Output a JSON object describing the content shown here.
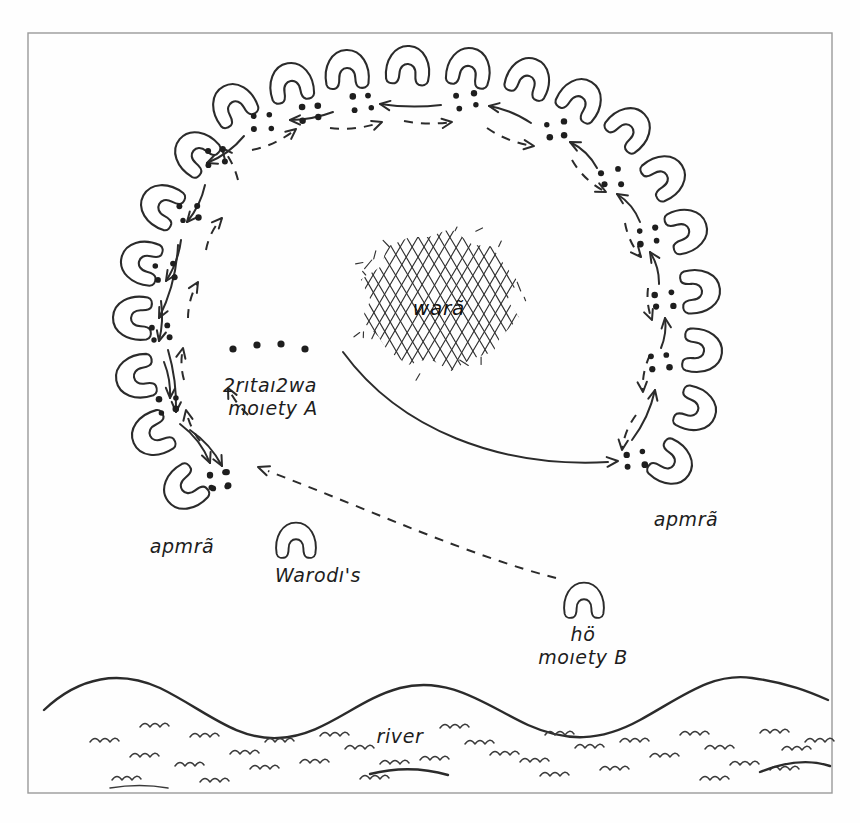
{
  "figure": {
    "type": "hand-drawn-ethnographic-diagram",
    "title_center": "warã",
    "background_color": "#fefefe",
    "ink_color": "#2b2b2b",
    "frame": {
      "x": 28,
      "y": 33,
      "width": 804,
      "height": 760
    }
  },
  "labels": {
    "center_plaza": "warã",
    "moiety_a_name": "2rıtaı2wa",
    "moiety_a_sub": "moıety A",
    "moiety_b_name": "hö",
    "moiety_b_sub": "moıety B",
    "house_left": "apmrã",
    "house_right": "apmrã",
    "warodis": "Warodı's",
    "river": "river"
  },
  "houses": [
    {
      "cx": 233,
      "cy": 104,
      "rot": -118,
      "s": 1.0
    },
    {
      "cx": 291,
      "cy": 83,
      "rot": -100,
      "s": 1.0
    },
    {
      "cx": 347,
      "cy": 70,
      "rot": -92,
      "s": 1.0
    },
    {
      "cx": 408,
      "cy": 66,
      "rot": -86,
      "s": 1.0
    },
    {
      "cx": 469,
      "cy": 68,
      "rot": -80,
      "s": 1.0
    },
    {
      "cx": 529,
      "cy": 78,
      "rot": -70,
      "s": 1.0
    },
    {
      "cx": 581,
      "cy": 99,
      "rot": -58,
      "s": 1.0
    },
    {
      "cx": 630,
      "cy": 128,
      "rot": -44,
      "s": 1.0
    },
    {
      "cx": 665,
      "cy": 176,
      "rot": -32,
      "s": 1.0
    },
    {
      "cx": 687,
      "cy": 230,
      "rot": -18,
      "s": 1.0
    },
    {
      "cx": 700,
      "cy": 291,
      "rot": -6,
      "s": 1.0
    },
    {
      "cx": 702,
      "cy": 351,
      "rot": 6,
      "s": 1.0
    },
    {
      "cx": 696,
      "cy": 410,
      "rot": 20,
      "s": 1.0
    },
    {
      "cx": 672,
      "cy": 464,
      "rot": 34,
      "s": 1.0
    },
    {
      "cx": 195,
      "cy": 152,
      "rot": -140,
      "s": 1.0
    },
    {
      "cx": 161,
      "cy": 205,
      "rot": -152,
      "s": 1.0
    },
    {
      "cx": 141,
      "cy": 262,
      "rot": -166,
      "s": 1.0
    },
    {
      "cx": 133,
      "cy": 318,
      "rot": -178,
      "s": 1.0
    },
    {
      "cx": 136,
      "cy": 377,
      "rot": 170,
      "s": 1.0
    },
    {
      "cx": 152,
      "cy": 435,
      "rot": 156,
      "s": 1.0
    },
    {
      "cx": 184,
      "cy": 489,
      "rot": 142,
      "s": 1.0
    }
  ],
  "dot_clusters": [
    {
      "cx": 216,
      "cy": 157
    },
    {
      "cx": 262,
      "cy": 123
    },
    {
      "cx": 310,
      "cy": 113
    },
    {
      "cx": 362,
      "cy": 103
    },
    {
      "cx": 466,
      "cy": 101
    },
    {
      "cx": 556,
      "cy": 130
    },
    {
      "cx": 611,
      "cy": 178
    },
    {
      "cx": 648,
      "cy": 236
    },
    {
      "cx": 664,
      "cy": 300
    },
    {
      "cx": 660,
      "cy": 363
    },
    {
      "cx": 635,
      "cy": 460
    },
    {
      "cx": 189,
      "cy": 213
    },
    {
      "cx": 165,
      "cy": 272
    },
    {
      "cx": 160,
      "cy": 333
    },
    {
      "cx": 168,
      "cy": 405
    },
    {
      "cx": 219,
      "cy": 481
    }
  ],
  "moiety_a_dots": [
    {
      "cx": 233,
      "cy": 349
    },
    {
      "cx": 257,
      "cy": 345
    },
    {
      "cx": 281,
      "cy": 344
    },
    {
      "cx": 305,
      "cy": 349
    }
  ],
  "connections": {
    "solid_description": "solid arrows run clockwise/inward between adjacent dot clusters",
    "dashed_description": "dashed arrows run counter-clockwise between adjacent dot clusters",
    "long_solid": "from warã plaza edge curving to right apmrã cluster",
    "long_dashed": "from hö moiety B house up-left to lower-left apmrã cluster"
  },
  "river": {
    "label": "river",
    "shore_y": 700,
    "wave_count": 28
  }
}
